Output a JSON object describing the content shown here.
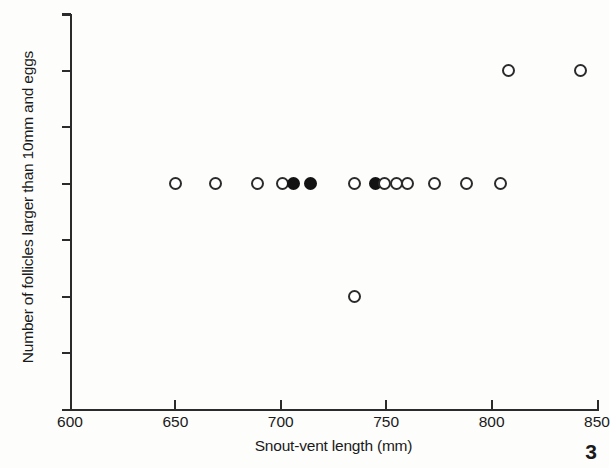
{
  "figure": {
    "page_number": "3"
  },
  "chart_data": {
    "type": "scatter",
    "title": "",
    "xlabel": "Snout-vent length (mm)",
    "ylabel": "Number of follicles larger than 10mm and eggs",
    "xlim": [
      600,
      850
    ],
    "ylim": [
      0.0,
      3.5
    ],
    "xticks": [
      600,
      650,
      700,
      750,
      800,
      850
    ],
    "yticks": [
      0.0,
      0.5,
      1.0,
      1.5,
      2.0,
      2.5,
      3.0,
      3.5
    ],
    "xtick_labels": [
      "600",
      "650",
      "700",
      "750",
      "800",
      "850"
    ],
    "ytick_labels": [
      "0.0",
      "0.5",
      "1.0",
      "1.5",
      "2.0",
      "2.5",
      "3.0",
      "3.5"
    ],
    "grid": false,
    "legend": null,
    "marker_styles": {
      "open": "open circle",
      "filled": "filled circle"
    },
    "points": [
      {
        "x": 650,
        "y": 2.0,
        "style": "open"
      },
      {
        "x": 669,
        "y": 2.0,
        "style": "open"
      },
      {
        "x": 689,
        "y": 2.0,
        "style": "open"
      },
      {
        "x": 701,
        "y": 2.0,
        "style": "open"
      },
      {
        "x": 706,
        "y": 2.0,
        "style": "filled"
      },
      {
        "x": 714,
        "y": 2.0,
        "style": "filled"
      },
      {
        "x": 735,
        "y": 2.0,
        "style": "open"
      },
      {
        "x": 745,
        "y": 2.0,
        "style": "filled"
      },
      {
        "x": 749,
        "y": 2.0,
        "style": "open"
      },
      {
        "x": 755,
        "y": 2.0,
        "style": "open"
      },
      {
        "x": 760,
        "y": 2.0,
        "style": "open"
      },
      {
        "x": 773,
        "y": 2.0,
        "style": "open"
      },
      {
        "x": 788,
        "y": 2.0,
        "style": "open"
      },
      {
        "x": 804,
        "y": 2.0,
        "style": "open"
      },
      {
        "x": 735,
        "y": 1.0,
        "style": "open"
      },
      {
        "x": 808,
        "y": 3.0,
        "style": "open"
      },
      {
        "x": 842,
        "y": 3.0,
        "style": "open"
      }
    ]
  }
}
